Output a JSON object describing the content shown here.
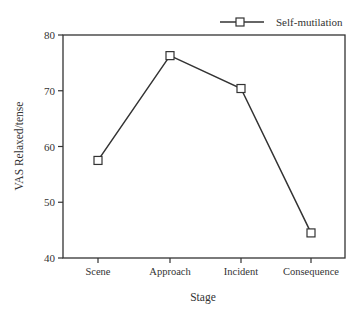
{
  "chart_data": {
    "type": "line",
    "title": "",
    "xlabel": "Stage",
    "ylabel": "VAS Relaxed/tense",
    "categories": [
      "Scene",
      "Approach",
      "Incident",
      "Consequence"
    ],
    "series": [
      {
        "name": "Self-mutilation",
        "marker": "open-square",
        "color": "#333333",
        "values": [
          57.5,
          76.3,
          70.4,
          44.5
        ]
      }
    ],
    "ylim": [
      40,
      80
    ],
    "yticks": [
      40,
      50,
      60,
      70,
      80
    ],
    "grid": false,
    "legend_position": "top-right-above-plot"
  },
  "legend": {
    "label": "Self-mutilation"
  },
  "axes": {
    "x_label": "Stage",
    "y_label": "VAS Relaxed/tense",
    "y_tick_labels": [
      "40",
      "50",
      "60",
      "70",
      "80"
    ],
    "x_tick_labels": [
      "Scene",
      "Approach",
      "Incident",
      "Consequence"
    ]
  }
}
